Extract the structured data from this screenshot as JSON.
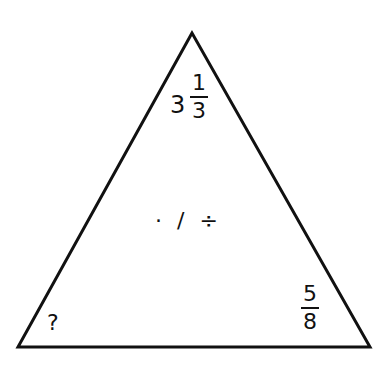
{
  "triangle": {
    "top": {
      "whole": "3",
      "numerator": "1",
      "denominator": "3"
    },
    "center_operators": "· / ÷",
    "bottom_left": "?",
    "bottom_right": {
      "numerator": "5",
      "denominator": "8"
    }
  }
}
